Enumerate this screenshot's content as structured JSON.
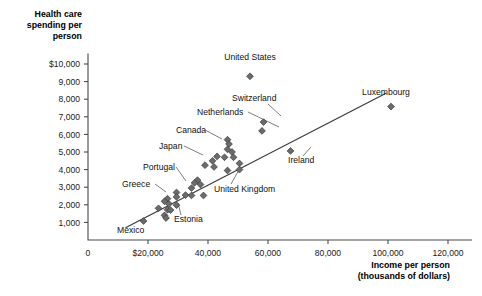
{
  "chart_data": {
    "type": "scatter",
    "title": "",
    "ylabel_lines": [
      "Health care",
      "spending per",
      "person"
    ],
    "xlabel_lines": [
      "Income per person",
      "(thousands of dollars)"
    ],
    "xlabel": "Income per person (thousands of dollars)",
    "ylabel": "Health care spending per person",
    "grid": false,
    "legend": "none",
    "xlim": [
      0,
      128000
    ],
    "ylim": [
      0,
      10600
    ],
    "x_ticks": [
      {
        "value": 0,
        "label": "0"
      },
      {
        "value": 20000,
        "label": "$20,000"
      },
      {
        "value": 40000,
        "label": "40,000"
      },
      {
        "value": 60000,
        "label": "60,000"
      },
      {
        "value": 80000,
        "label": "80,000"
      },
      {
        "value": 100000,
        "label": "100,000"
      },
      {
        "value": 120000,
        "label": "120,000"
      }
    ],
    "y_ticks": [
      {
        "value": 1000,
        "label": "1,000"
      },
      {
        "value": 2000,
        "label": "2,000"
      },
      {
        "value": 3000,
        "label": "3,000"
      },
      {
        "value": 4000,
        "label": "4,000"
      },
      {
        "value": 5000,
        "label": "5,000"
      },
      {
        "value": 6000,
        "label": "6,000"
      },
      {
        "value": 7000,
        "label": "7,000"
      },
      {
        "value": 8000,
        "label": "8,000"
      },
      {
        "value": 9000,
        "label": "9,000"
      },
      {
        "value": 10000,
        "label": "$10,000"
      }
    ],
    "trendline": {
      "x0": 12500,
      "y0": 700,
      "x1": 99500,
      "y1": 8350
    },
    "points": [
      {
        "x": 54000,
        "y": 9300,
        "label": "United States"
      },
      {
        "x": 101000,
        "y": 7580,
        "label": "Luxembourg"
      },
      {
        "x": 58500,
        "y": 6700,
        "label": "Switzerland"
      },
      {
        "x": 58000,
        "y": 6200,
        "label": "Netherlands"
      },
      {
        "x": 46500,
        "y": 5700,
        "label": "Canada"
      },
      {
        "x": 47000,
        "y": 5450,
        "label": ""
      },
      {
        "x": 46500,
        "y": 5150,
        "label": ""
      },
      {
        "x": 48000,
        "y": 5000,
        "label": ""
      },
      {
        "x": 67500,
        "y": 5060,
        "label": "Ireland"
      },
      {
        "x": 43000,
        "y": 4750,
        "label": ""
      },
      {
        "x": 45500,
        "y": 4700,
        "label": ""
      },
      {
        "x": 48500,
        "y": 4700,
        "label": ""
      },
      {
        "x": 41500,
        "y": 4500,
        "label": ""
      },
      {
        "x": 50500,
        "y": 4350,
        "label": ""
      },
      {
        "x": 39000,
        "y": 4250,
        "label": "Japan"
      },
      {
        "x": 42000,
        "y": 4150,
        "label": ""
      },
      {
        "x": 50500,
        "y": 4000,
        "label": ""
      },
      {
        "x": 46500,
        "y": 3950,
        "label": "United Kingdom"
      },
      {
        "x": 36500,
        "y": 3400,
        "label": ""
      },
      {
        "x": 35500,
        "y": 3250,
        "label": ""
      },
      {
        "x": 37500,
        "y": 3150,
        "label": ""
      },
      {
        "x": 34500,
        "y": 2950,
        "label": ""
      },
      {
        "x": 29500,
        "y": 2700,
        "label": "Portugal"
      },
      {
        "x": 32500,
        "y": 2550,
        "label": ""
      },
      {
        "x": 34500,
        "y": 2530,
        "label": ""
      },
      {
        "x": 38500,
        "y": 2530,
        "label": ""
      },
      {
        "x": 29500,
        "y": 2450,
        "label": ""
      },
      {
        "x": 26500,
        "y": 2350,
        "label": "Greece"
      },
      {
        "x": 25500,
        "y": 2200,
        "label": ""
      },
      {
        "x": 27000,
        "y": 2050,
        "label": ""
      },
      {
        "x": 29500,
        "y": 1980,
        "label": "Estonia"
      },
      {
        "x": 23500,
        "y": 1800,
        "label": ""
      },
      {
        "x": 26500,
        "y": 1720,
        "label": ""
      },
      {
        "x": 27500,
        "y": 1700,
        "label": ""
      },
      {
        "x": 25500,
        "y": 1400,
        "label": ""
      },
      {
        "x": 26000,
        "y": 1250,
        "label": ""
      },
      {
        "x": 18500,
        "y": 1080,
        "label": "Mexico"
      }
    ],
    "annotations": [
      {
        "text": "United States",
        "anchor": "middle",
        "tx": 250,
        "ty": 60,
        "leader": null
      },
      {
        "text": "Luxembourg",
        "anchor": "middle",
        "tx": 386,
        "ty": 95,
        "leader": null
      },
      {
        "text": "Switzerland",
        "anchor": "start",
        "tx": 232,
        "ty": 101,
        "leader": [
          [
            268,
            104
          ],
          [
            281,
            116
          ]
        ]
      },
      {
        "text": "Netherlands",
        "anchor": "start",
        "tx": 197,
        "ty": 115,
        "leader": [
          [
            248,
            112
          ],
          [
            279,
            127
          ]
        ]
      },
      {
        "text": "Canada",
        "anchor": "start",
        "tx": 176,
        "ty": 133,
        "leader": [
          [
            205,
            130
          ],
          [
            222,
            139
          ]
        ]
      },
      {
        "text": "Japan",
        "anchor": "start",
        "tx": 159,
        "ty": 149,
        "leader": [
          [
            184,
            146
          ],
          [
            203,
            155
          ]
        ]
      },
      {
        "text": "Portugal",
        "anchor": "start",
        "tx": 143,
        "ty": 170,
        "leader": [
          [
            176,
            167
          ],
          [
            186,
            181
          ]
        ]
      },
      {
        "text": "Greece",
        "anchor": "start",
        "tx": 122,
        "ty": 187,
        "leader": [
          [
            155,
            184
          ],
          [
            166,
            192
          ]
        ]
      },
      {
        "text": "United Kingdom",
        "anchor": "start",
        "tx": 214,
        "ty": 192,
        "leader": [
          [
            231,
            184
          ],
          [
            240,
            168
          ]
        ]
      },
      {
        "text": "Estonia",
        "anchor": "start",
        "tx": 174,
        "ty": 222,
        "leader": [
          [
            181,
            215
          ],
          [
            178,
            203
          ]
        ]
      },
      {
        "text": "Mexico",
        "anchor": "start",
        "tx": 117,
        "ty": 233,
        "leader": null
      },
      {
        "text": "Ireland",
        "anchor": "start",
        "tx": 288,
        "ty": 163,
        "leader": [
          [
            303,
            156
          ],
          [
            311,
            147
          ]
        ]
      }
    ],
    "colors": {
      "marker_fill": "#6b6b6b",
      "marker_stroke": "#3a3a3a",
      "axis": "#4a4a4a",
      "trendline": "#3c3c3c",
      "text": "#1a1a1a",
      "background": "#ffffff"
    }
  }
}
